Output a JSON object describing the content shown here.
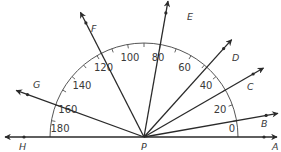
{
  "diagram": {
    "vertex": {
      "label": "P",
      "x": 144,
      "y": 137
    },
    "arc_radius": 94,
    "scale_labels": [
      {
        "text": "0",
        "deg": 0
      },
      {
        "text": "20",
        "deg": 20
      },
      {
        "text": "40",
        "deg": 40
      },
      {
        "text": "60",
        "deg": 60
      },
      {
        "text": "80",
        "deg": 80
      },
      {
        "text": "100",
        "deg": 100
      },
      {
        "text": "120",
        "deg": 120
      },
      {
        "text": "140",
        "deg": 140
      },
      {
        "text": "160",
        "deg": 160
      },
      {
        "text": "180",
        "deg": 180
      }
    ],
    "rays": [
      {
        "label": "A",
        "deg": 0
      },
      {
        "label": "B",
        "deg": 10
      },
      {
        "label": "C",
        "deg": 30
      },
      {
        "label": "D",
        "deg": 48
      },
      {
        "label": "E",
        "deg": 80
      },
      {
        "label": "F",
        "deg": 117
      },
      {
        "label": "G",
        "deg": 160
      },
      {
        "label": "H",
        "deg": 180
      }
    ],
    "colors": {
      "line": "#2a2a2a",
      "arc": "#555555",
      "text": "#3a3a3a"
    }
  }
}
